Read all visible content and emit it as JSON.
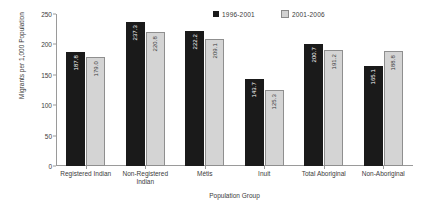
{
  "chart_data": {
    "type": "bar",
    "title": "",
    "xlabel": "Population Group",
    "ylabel": "Migrants per 1,000 Population",
    "ylim": [
      0,
      250
    ],
    "yticks": [
      0,
      50,
      100,
      150,
      200,
      250
    ],
    "grid": false,
    "legend_position": "top-right",
    "categories": [
      "Registered Indian",
      "Non-Registered Indian",
      "Métis",
      "Inuit",
      "Total Aboriginal",
      "Non-Aboriginal"
    ],
    "series": [
      {
        "name": "1996-2001",
        "color": "#1a1a1a",
        "values": [
          187.8,
          237.3,
          222.2,
          143.7,
          200.7,
          165.1
        ],
        "labels": [
          "187.8",
          "237.3",
          "222.2",
          "143.7",
          "200.7",
          "165.1"
        ]
      },
      {
        "name": "2001-2006",
        "color": "#d4d4d4",
        "values": [
          179.0,
          220.8,
          209.1,
          125.3,
          191.2,
          188.8
        ],
        "labels": [
          "179.0",
          "220.8",
          "209.1",
          "125.3",
          "191.2",
          "188.8"
        ]
      }
    ]
  }
}
